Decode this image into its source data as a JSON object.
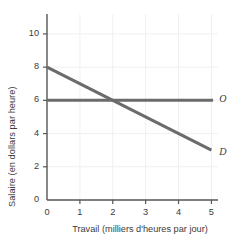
{
  "chart_data": {
    "type": "line",
    "title": "",
    "xlabel": "Travail (milliers d'heures par jour)",
    "ylabel": "Salaire (en dollars par heure)",
    "xlim": [
      0,
      5.2
    ],
    "ylim": [
      0,
      11.2
    ],
    "xticks": [
      0,
      1,
      2,
      3,
      4,
      5
    ],
    "xtick_labels": [
      "0",
      "1",
      "2",
      "3",
      "4",
      "5"
    ],
    "yticks": [
      0,
      2,
      4,
      6,
      8,
      10
    ],
    "ytick_labels": [
      "0",
      "2",
      "4",
      "6",
      "8",
      "10"
    ],
    "grid": true,
    "grid_color": "#f0f0f0",
    "line_color": "#6b6b6b",
    "axis_color": "#555555",
    "legend_position": "inline-right",
    "series": [
      {
        "name": "D",
        "label": "D",
        "description": "Courbe de demande de travail",
        "points": [
          [
            0,
            8
          ],
          [
            5,
            3
          ]
        ],
        "label_x": 5.18,
        "label_y": 2.85
      },
      {
        "name": "O",
        "label": "O",
        "description": "Courbe d'offre de travail",
        "points": [
          [
            0,
            6
          ],
          [
            5.05,
            6
          ]
        ],
        "label_x": 5.18,
        "label_y": 6.0
      }
    ],
    "annotations": [
      {
        "name": "equilibrium",
        "x": 2,
        "y": 6,
        "visible": false
      }
    ]
  }
}
